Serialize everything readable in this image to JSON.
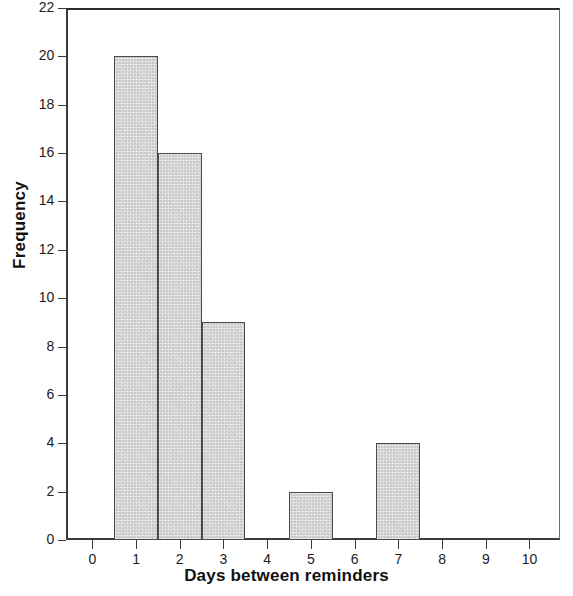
{
  "chart_data": {
    "type": "bar",
    "title": "",
    "subtitle": "",
    "xlabel": "Days between reminders",
    "ylabel": "Frequency",
    "categories": [
      "0",
      "1",
      "2",
      "3",
      "4",
      "5",
      "6",
      "7",
      "8",
      "9",
      "10"
    ],
    "values": [
      0,
      20,
      16,
      9,
      0,
      2,
      0,
      4,
      0,
      0,
      0
    ],
    "bars": [
      {
        "x": 1,
        "value": 20
      },
      {
        "x": 2,
        "value": 16
      },
      {
        "x": 3,
        "value": 9
      },
      {
        "x": 5,
        "value": 2
      },
      {
        "x": 7,
        "value": 4
      }
    ],
    "bar_width": 1,
    "xlim": [
      -0.6,
      10.7
    ],
    "ylim": [
      0,
      22
    ],
    "xticks": [
      "0",
      "1",
      "2",
      "3",
      "4",
      "5",
      "6",
      "7",
      "8",
      "9",
      "10"
    ],
    "yticks": [
      "0",
      "2",
      "4",
      "6",
      "8",
      "10",
      "12",
      "14",
      "16",
      "18",
      "20",
      "22"
    ],
    "grid": false,
    "legend": false,
    "legend_position": "none",
    "bar_fill_color": "#dcdcdc",
    "bar_edge_color": "#4a4a4a",
    "axis_color": "#3a3a3a",
    "background_color": "#ffffff"
  }
}
